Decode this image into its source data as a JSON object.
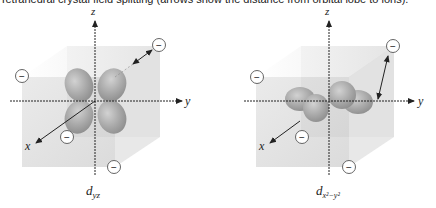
{
  "caption": "Tetrahedral crystal field splitting (arrows show the distance from orbital lobe to ions).",
  "ion_symbol": "−",
  "colors": {
    "cube_face": "#d9d9d9",
    "cube_back": "#cfcfcf",
    "orbital": "#a9a9a9",
    "axis": "#222222",
    "ion_fill": "#ffffff",
    "ion_stroke": "#555555"
  },
  "panels": [
    {
      "orbital_label": "d",
      "orbital_subscript": "yz",
      "axes": {
        "z": "z",
        "y": "y",
        "x": "x"
      }
    },
    {
      "orbital_label": "d",
      "orbital_subscript": "x²−y²",
      "axes": {
        "z": "z",
        "y": "y",
        "x": "x"
      }
    }
  ]
}
